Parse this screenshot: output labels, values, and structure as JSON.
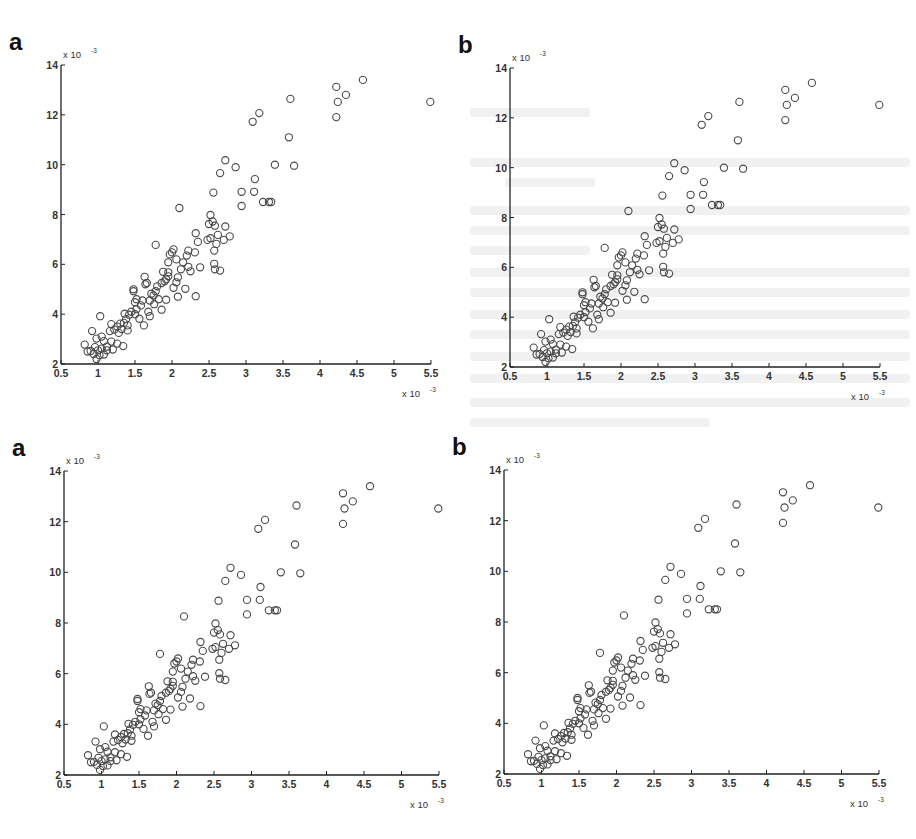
{
  "figure": {
    "panels": [
      {
        "id": "top-left",
        "letter": "a",
        "left": 0,
        "top": 0,
        "origin": [
          61,
          364
        ],
        "xmax_px": 431,
        "ytop_px": 65
      },
      {
        "id": "top-right",
        "letter": "b",
        "left": 0,
        "top": 0,
        "origin": [
          510,
          367
        ],
        "xmax_px": 880,
        "ytop_px": 68
      },
      {
        "id": "bottom-left",
        "letter": "a",
        "left": 0,
        "top": 0,
        "origin": [
          64,
          775
        ],
        "xmax_px": 439,
        "ytop_px": 471
      },
      {
        "id": "bottom-right",
        "letter": "b",
        "left": 0,
        "top": 0,
        "origin": [
          504,
          774
        ],
        "xmax_px": 879,
        "ytop_px": 470
      }
    ],
    "x_multiplier_label": "x 10",
    "y_multiplier_label": "x 10",
    "exponent": "-3",
    "marker_color": "#4a4a4a"
  },
  "chart_data": [
    {
      "type": "scatter",
      "panel_label": "a",
      "title": "",
      "xlabel": "",
      "ylabel": "",
      "x_scale_note": "x 10^-3",
      "y_scale_note": "x 10^-3",
      "xlim": [
        0.5,
        5.5
      ],
      "ylim": [
        2,
        14
      ],
      "xticks": [
        "0.5",
        "1",
        "1.5",
        "2",
        "2.5",
        "3",
        "3.5",
        "4",
        "4.5",
        "5",
        "5.5"
      ],
      "yticks": [
        "2",
        "4",
        "6",
        "8",
        "10",
        "12",
        "14"
      ],
      "grid": false,
      "marker": "open-circle",
      "points": "shared"
    },
    {
      "type": "scatter",
      "panel_label": "b",
      "xlim": [
        0.5,
        5.5
      ],
      "ylim": [
        2,
        14
      ],
      "xticks": [
        "0.5",
        "1",
        "1.5",
        "2",
        "2.5",
        "3",
        "3.5",
        "4",
        "4.5",
        "5",
        "5.5"
      ],
      "yticks": [
        "2",
        "4",
        "6",
        "8",
        "10",
        "12",
        "14"
      ],
      "x_scale_note": "x 10^-3",
      "y_scale_note": "x 10^-3",
      "grid": false,
      "marker": "open-circle",
      "points": "shared"
    },
    {
      "type": "scatter",
      "panel_label": "a",
      "xlim": [
        0.5,
        5.5
      ],
      "ylim": [
        2,
        14
      ],
      "xticks": [
        "0.5",
        "1",
        "1.5",
        "2",
        "2.5",
        "3",
        "3.5",
        "4",
        "4.5",
        "5",
        "5.5"
      ],
      "yticks": [
        "2",
        "4",
        "6",
        "8",
        "10",
        "12",
        "14"
      ],
      "x_scale_note": "x 10^-3",
      "y_scale_note": "x 10^-3",
      "grid": false,
      "marker": "open-circle",
      "points": "shared"
    },
    {
      "type": "scatter",
      "panel_label": "b",
      "xlim": [
        0.5,
        5.5
      ],
      "ylim": [
        2,
        14
      ],
      "xticks": [
        "0.5",
        "1",
        "1.5",
        "2",
        "2.5",
        "3",
        "3.5",
        "4",
        "4.5",
        "5",
        "5.5"
      ],
      "yticks": [
        "2",
        "4",
        "6",
        "8",
        "10",
        "12",
        "14"
      ],
      "x_scale_note": "x 10^-3",
      "y_scale_note": "x 10^-3",
      "grid": false,
      "marker": "open-circle",
      "points": "shared"
    }
  ],
  "shared_points": [
    [
      5.49,
      12.52
    ],
    [
      4.58,
      13.4
    ],
    [
      4.22,
      13.12
    ],
    [
      4.35,
      12.8
    ],
    [
      4.24,
      12.52
    ],
    [
      4.22,
      11.91
    ],
    [
      3.6,
      12.64
    ],
    [
      3.18,
      12.07
    ],
    [
      3.09,
      11.72
    ],
    [
      3.58,
      11.1
    ],
    [
      3.39,
      10.0
    ],
    [
      3.65,
      9.96
    ],
    [
      2.72,
      10.18
    ],
    [
      2.86,
      9.9
    ],
    [
      2.65,
      9.66
    ],
    [
      3.12,
      9.42
    ],
    [
      2.94,
      8.91
    ],
    [
      3.11,
      8.91
    ],
    [
      2.56,
      8.88
    ],
    [
      2.94,
      8.34
    ],
    [
      3.23,
      8.5
    ],
    [
      3.31,
      8.5
    ],
    [
      3.34,
      8.5
    ],
    [
      2.1,
      8.26
    ],
    [
      2.52,
      7.98
    ],
    [
      2.5,
      7.62
    ],
    [
      2.55,
      7.72
    ],
    [
      2.58,
      7.55
    ],
    [
      2.72,
      7.52
    ],
    [
      2.78,
      7.12
    ],
    [
      2.62,
      7.18
    ],
    [
      2.7,
      6.98
    ],
    [
      2.48,
      6.98
    ],
    [
      2.52,
      7.05
    ],
    [
      2.6,
      6.82
    ],
    [
      2.57,
      6.55
    ],
    [
      2.57,
      6.02
    ],
    [
      2.58,
      5.8
    ],
    [
      2.65,
      5.75
    ],
    [
      2.32,
      7.25
    ],
    [
      2.35,
      6.9
    ],
    [
      2.31,
      6.48
    ],
    [
      2.22,
      6.55
    ],
    [
      2.2,
      6.35
    ],
    [
      2.15,
      6.08
    ],
    [
      2.06,
      6.2
    ],
    [
      2.02,
      6.6
    ],
    [
      2.0,
      6.48
    ],
    [
      1.97,
      6.4
    ],
    [
      1.95,
      6.08
    ],
    [
      1.78,
      6.78
    ],
    [
      2.12,
      5.8
    ],
    [
      2.22,
      5.9
    ],
    [
      2.25,
      5.72
    ],
    [
      2.38,
      5.88
    ],
    [
      2.18,
      5.02
    ],
    [
      2.32,
      4.72
    ],
    [
      2.08,
      5.48
    ],
    [
      2.06,
      5.28
    ],
    [
      2.02,
      5.06
    ],
    [
      2.08,
      4.7
    ],
    [
      1.95,
      5.68
    ],
    [
      1.92,
      5.4
    ],
    [
      1.9,
      5.32
    ],
    [
      1.95,
      5.52
    ],
    [
      1.88,
      5.7
    ],
    [
      1.86,
      5.25
    ],
    [
      1.92,
      4.58
    ],
    [
      1.8,
      5.12
    ],
    [
      1.78,
      4.92
    ],
    [
      1.75,
      4.75
    ],
    [
      1.72,
      4.82
    ],
    [
      1.7,
      4.55
    ],
    [
      1.76,
      4.4
    ],
    [
      1.82,
      4.6
    ],
    [
      1.86,
      4.18
    ],
    [
      1.66,
      5.25
    ],
    [
      1.63,
      5.5
    ],
    [
      1.64,
      5.2
    ],
    [
      1.68,
      4.1
    ],
    [
      1.7,
      3.92
    ],
    [
      1.6,
      4.55
    ],
    [
      1.58,
      4.35
    ],
    [
      1.62,
      3.55
    ],
    [
      1.48,
      4.92
    ],
    [
      1.48,
      5.0
    ],
    [
      1.5,
      4.48
    ],
    [
      1.52,
      4.2
    ],
    [
      1.5,
      4.0
    ],
    [
      1.56,
      3.82
    ],
    [
      1.45,
      4.1
    ],
    [
      1.42,
      3.98
    ],
    [
      1.38,
      3.8
    ],
    [
      1.4,
      3.55
    ],
    [
      1.35,
      3.65
    ],
    [
      1.32,
      3.4
    ],
    [
      1.36,
      4.02
    ],
    [
      1.3,
      3.62
    ],
    [
      1.26,
      3.5
    ],
    [
      1.22,
      3.38
    ],
    [
      1.18,
      3.6
    ],
    [
      1.16,
      3.32
    ],
    [
      1.28,
      3.25
    ],
    [
      1.4,
      3.35
    ],
    [
      1.34,
      2.72
    ],
    [
      1.26,
      2.82
    ],
    [
      1.18,
      2.9
    ],
    [
      1.2,
      2.58
    ],
    [
      1.12,
      2.7
    ],
    [
      1.08,
      2.92
    ],
    [
      1.05,
      3.1
    ],
    [
      1.03,
      3.92
    ],
    [
      0.98,
      3.02
    ],
    [
      0.92,
      3.32
    ],
    [
      1.0,
      2.55
    ],
    [
      0.96,
      2.68
    ],
    [
      0.9,
      2.52
    ],
    [
      0.86,
      2.5
    ],
    [
      0.82,
      2.78
    ],
    [
      0.94,
      2.4
    ],
    [
      0.98,
      2.2
    ],
    [
      1.02,
      2.35
    ],
    [
      1.08,
      2.38
    ],
    [
      1.12,
      2.55
    ],
    [
      1.05,
      2.62
    ],
    [
      1.52,
      4.6
    ]
  ]
}
